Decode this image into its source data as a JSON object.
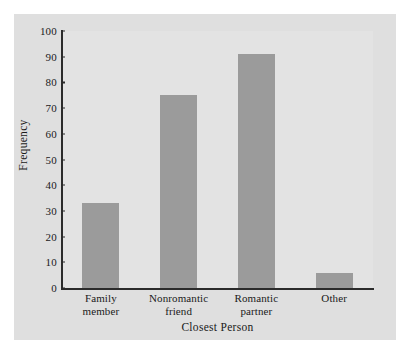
{
  "chart_data": {
    "type": "bar",
    "title": "",
    "xlabel": "Closest Person",
    "ylabel": "Frequency",
    "categories": [
      "Family member",
      "Nonromantic friend",
      "Romantic partner",
      "Other"
    ],
    "category_lines": [
      [
        "Family",
        "member"
      ],
      [
        "Nonromantic",
        "friend"
      ],
      [
        "Romantic",
        "partner"
      ],
      [
        "Other",
        ""
      ]
    ],
    "values": [
      33,
      75,
      91,
      6
    ],
    "ylim": [
      0,
      100
    ],
    "yticks": [
      0,
      10,
      20,
      30,
      40,
      50,
      60,
      70,
      80,
      90,
      100
    ],
    "ytick_labels": [
      "0",
      "10",
      "20",
      "30",
      "40",
      "50",
      "60",
      "70",
      "80",
      "90",
      "100"
    ],
    "grid": false,
    "legend": "none",
    "colors": {
      "bar_fill": "#9b9b9b",
      "panel_background": "#dfdfdf",
      "plot_background": "#e3e3e3",
      "axis_line": "#2b2b2b",
      "text": "#1a1a1a",
      "page_background": "#ffffff"
    }
  }
}
